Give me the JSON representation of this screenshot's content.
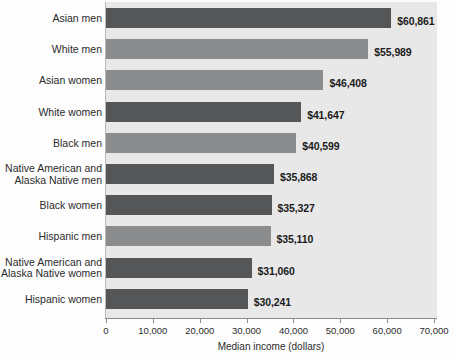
{
  "chart_data": {
    "type": "bar",
    "orientation": "horizontal",
    "title": "",
    "xlabel": "Median income (dollars)",
    "ylabel": "",
    "xlim": [
      0,
      70000
    ],
    "grid": false,
    "legend": null,
    "tick_labels": [
      "0",
      "10,000",
      "20,000",
      "30,000",
      "40,000",
      "50,000",
      "60,000",
      "70,000"
    ],
    "tick_values": [
      0,
      10000,
      20000,
      30000,
      40000,
      50000,
      60000,
      70000
    ],
    "categories": [
      "Asian men",
      "White men",
      "Asian women",
      "White women",
      "Black men",
      "Native American and\nAlaska Native men",
      "Black women",
      "Hispanic men",
      "Native American and\nAlaska Native women",
      "Hispanic women"
    ],
    "values": [
      60861,
      55989,
      46408,
      41647,
      40599,
      35868,
      35327,
      35110,
      31060,
      30241
    ],
    "value_labels": [
      "$60,861",
      "$55,989",
      "$46,408",
      "$41,647",
      "$40,599",
      "$35,868",
      "$35,327",
      "$35,110",
      "$31,060",
      "$30,241"
    ],
    "bar_shades": [
      "dark",
      "mid",
      "mid",
      "dark",
      "mid",
      "dark",
      "dark",
      "mid",
      "dark",
      "dark"
    ],
    "colors": {
      "bar_dark": "#555658",
      "bar_mid": "#8b8c8e",
      "plot_background": "#e8e8e8",
      "page_background": "#fdfdfd",
      "axis": "#8c8c8c",
      "text": "#2b2b2b"
    }
  }
}
